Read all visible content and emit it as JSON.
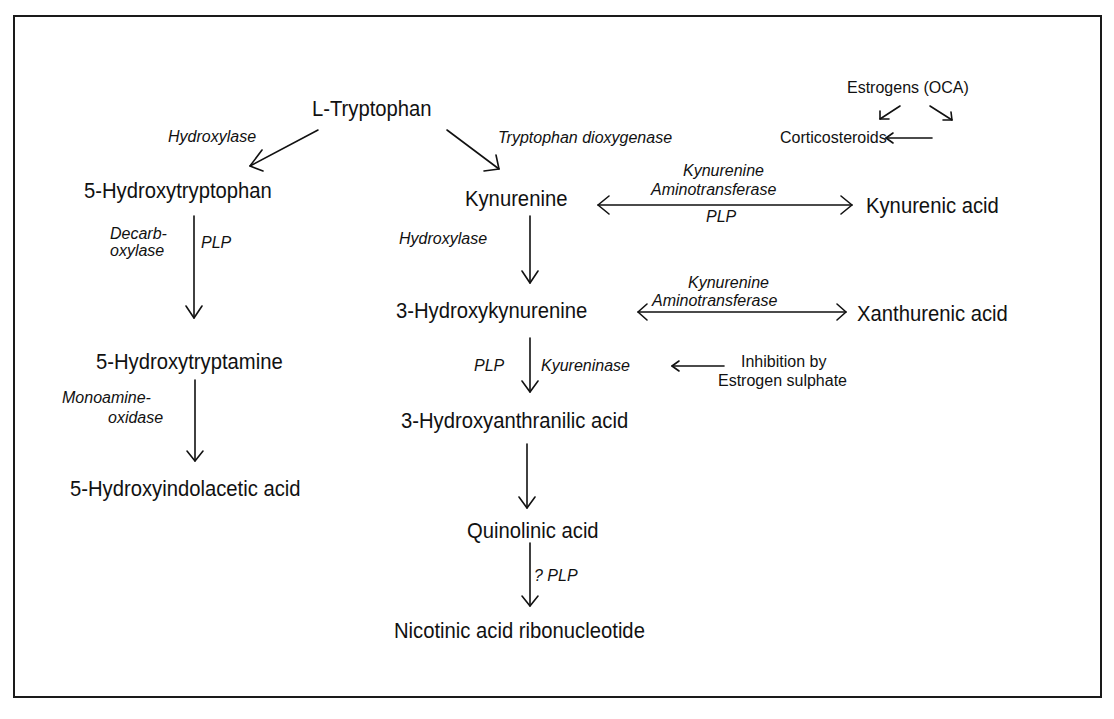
{
  "diagram": {
    "nodes": {
      "l_tryptophan": "L-Tryptophan",
      "hydroxytryptophan": "5-Hydroxytryptophan",
      "hydroxytryptamine": "5-Hydroxytryptamine",
      "hydroxyindolacetic_acid": "5-Hydroxyindolacetic acid",
      "kynurenine": "Kynurenine",
      "kynurenic_acid": "Kynurenic acid",
      "hydroxykynurenine": "3-Hydroxykynurenine",
      "xanthurenic_acid": "Xanthurenic acid",
      "hydroxyanthranilic_acid": "3-Hydroxyanthranilic acid",
      "quinolinic_acid": "Quinolinic acid",
      "nicotinic_acid_ribonucleotide": "Nicotinic acid ribonucleotide"
    },
    "regulators": {
      "estrogens": "Estrogens (OCA)",
      "corticosteroids": "Corticosteroids",
      "inhibition_line1": "Inhibition by",
      "inhibition_line2": "Estrogen sulphate"
    },
    "enzymes": {
      "hydroxylase_left": "Hydroxylase",
      "tryptophan_dioxygenase": "Tryptophan dioxygenase",
      "decarb_line1": "Decarb-",
      "decarb_line2": "oxylase",
      "plp_left": "PLP",
      "monoamine_line1": "Monoamine-",
      "monoamine_line2": "oxidase",
      "kat1_line1": "Kynurenine",
      "kat1_line2": "Aminotransferase",
      "kat1_cofactor": "PLP",
      "hydroxylase_center": "Hydroxylase",
      "kat2_line1": "Kynurenine",
      "kat2_line2": "Aminotransferase",
      "plp_center": "PLP",
      "kyureninase": "Kyureninase",
      "plp_question": "? PLP"
    },
    "edges": [
      {
        "from": "L-Tryptophan",
        "to": "5-Hydroxytryptophan",
        "label": "Hydroxylase"
      },
      {
        "from": "L-Tryptophan",
        "to": "Kynurenine",
        "label": "Tryptophan dioxygenase"
      },
      {
        "from": "Estrogens (OCA)",
        "to": "Tryptophan dioxygenase"
      },
      {
        "from": "Estrogens (OCA)",
        "to": "Corticosteroids"
      },
      {
        "from": "Corticosteroids",
        "to": "Tryptophan dioxygenase"
      },
      {
        "from": "5-Hydroxytryptophan",
        "to": "5-Hydroxytryptamine",
        "label": "Decarboxylase PLP"
      },
      {
        "from": "5-Hydroxytryptamine",
        "to": "5-Hydroxyindolacetic acid",
        "label": "Monoamine-oxidase"
      },
      {
        "from": "Kynurenine",
        "to": "Kynurenic acid",
        "label": "Kynurenine Aminotransferase PLP",
        "bidirectional": true
      },
      {
        "from": "Kynurenine",
        "to": "3-Hydroxykynurenine",
        "label": "Hydroxylase"
      },
      {
        "from": "3-Hydroxykynurenine",
        "to": "Xanthurenic acid",
        "label": "Kynurenine Aminotransferase",
        "bidirectional": true
      },
      {
        "from": "3-Hydroxykynurenine",
        "to": "3-Hydroxyanthranilic acid",
        "label": "PLP Kyureninase"
      },
      {
        "from": "Inhibition by Estrogen sulphate",
        "to": "Kyureninase"
      },
      {
        "from": "3-Hydroxyanthranilic acid",
        "to": "Quinolinic acid"
      },
      {
        "from": "Quinolinic acid",
        "to": "Nicotinic acid ribonucleotide",
        "label": "? PLP"
      }
    ]
  }
}
